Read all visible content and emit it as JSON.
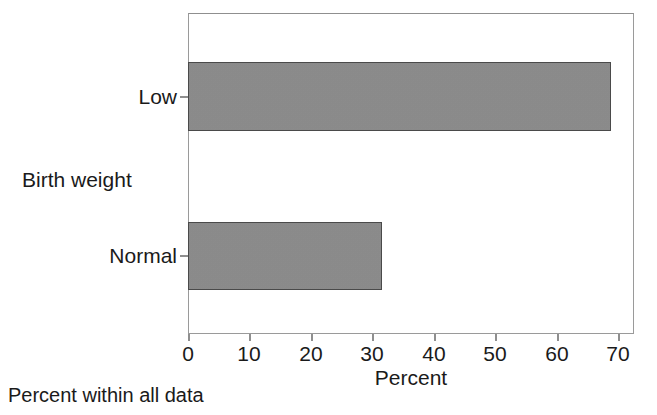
{
  "chart_data": {
    "type": "bar",
    "orientation": "horizontal",
    "title": "",
    "subtitle": "",
    "categories": [
      "Low",
      "Normal"
    ],
    "values": [
      68.7,
      31.5
    ],
    "series": [
      {
        "name": "Percent within all data",
        "values": [
          68.7,
          31.5
        ]
      }
    ],
    "xlabel": "Percent",
    "ylabel": "Birth weight",
    "xlim": [
      0,
      72.5
    ],
    "xticks": [
      0,
      10,
      20,
      30,
      40,
      50,
      60,
      70
    ],
    "xtick_labels": [
      "0",
      "10",
      "20",
      "30",
      "40",
      "50",
      "60",
      "70"
    ],
    "ytick_labels": [
      "Low",
      "Normal"
    ],
    "grid": false,
    "legend": false,
    "legend_position": "none",
    "annotations": [
      "Percent within all data"
    ],
    "bar_fill_color": "#8a8a8a",
    "bar_border_color": "#4a4a4a",
    "frame_color": "#9a9a9a",
    "background_color": "#ffffff"
  },
  "labels": {
    "y_axis_title": "Birth weight",
    "x_axis_title": "Percent",
    "footnote": "Percent within all data"
  }
}
